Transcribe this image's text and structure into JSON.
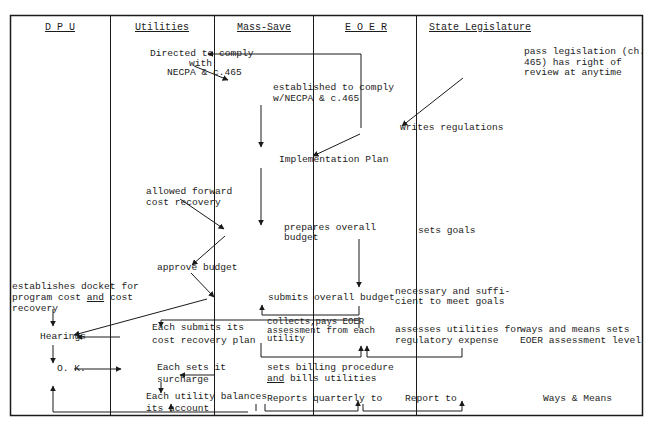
{
  "diagram": {
    "type": "swimlane-flowchart",
    "columns": [
      {
        "id": "dpu",
        "label": "D P U"
      },
      {
        "id": "utilities",
        "label": "Utilities"
      },
      {
        "id": "mass_save",
        "label": "Mass-Save"
      },
      {
        "id": "eoer",
        "label": "E O E R"
      },
      {
        "id": "state_legislature",
        "label": "State Legislature"
      }
    ],
    "nodes": {
      "directed_to_comply_1": "Directed to comply",
      "directed_to_comply_2": "with",
      "directed_to_comply_3": "NECPA & c.465",
      "established_1": "established to comply",
      "established_2": "w/NECPA & c.465",
      "pass_legislation_1": "pass legislation (ch.",
      "pass_legislation_2": "465) has right of",
      "pass_legislation_3": "review at anytime",
      "writes_regulations": "writes regulations",
      "implementation_plan": "Implementation Plan",
      "allowed_forward_1": "allowed forward",
      "allowed_forward_2": "cost recovery",
      "prepares_budget_1": "prepares overall",
      "prepares_budget_2": "budget",
      "sets_goals": "sets goals",
      "approve_budget": "approve budget",
      "establishes_docket_1": "establishes docket for",
      "establishes_docket_2a": "program cost ",
      "establishes_docket_2b": "and",
      "establishes_docket_2c": " cost",
      "establishes_docket_3": "recovery",
      "submits_overall_budget": "submits overall budget",
      "necessary_1": "necessary and suffi-",
      "necessary_2": "cient to meet goals",
      "hearings": "Hearings",
      "each_submits_1": "Each submits its",
      "each_submits_2": "cost recovery plan",
      "collects_1": "collects,pays EOER",
      "collects_2": "assessment from each",
      "collects_3": "utility",
      "assesses_1": "assesses utilities for",
      "assesses_2": "regulatory expense",
      "ways_means_sets_1": "ways and means sets",
      "ways_means_sets_2": "EOER assessment level",
      "ok": "O. K.",
      "each_sets_1": "Each sets it",
      "each_sets_2": "surcharge",
      "sets_billing_1": "sets billing procedure",
      "sets_billing_2a": "and",
      "sets_billing_2b": " bills utilities",
      "each_utility_1": "Each utility balances",
      "each_utility_2": "its account",
      "reports_quarterly": "Reports quarterly to",
      "report_to": "Report to",
      "ways_and_means": "Ways & Means"
    },
    "edges": [
      {
        "from": "writes_regulations",
        "to": "directed_to_comply"
      },
      {
        "from": "directed_to_comply",
        "to": "established"
      },
      {
        "from": "established",
        "to": "implementation_plan"
      },
      {
        "from": "pass_legislation",
        "to": "writes_regulations"
      },
      {
        "from": "writes_regulations",
        "to": "implementation_plan"
      },
      {
        "from": "implementation_plan",
        "to": "prepares_budget"
      },
      {
        "from": "allowed_forward",
        "to": "prepares_budget"
      },
      {
        "from": "prepares_budget",
        "to": "approve_budget"
      },
      {
        "from": "approve_budget",
        "to": "submits_overall_budget"
      },
      {
        "from": "sets_goals",
        "to": "necessary"
      },
      {
        "from": "necessary",
        "to": "submits_overall_budget"
      },
      {
        "from": "necessary",
        "to": "each_submits"
      },
      {
        "from": "submits_overall_budget",
        "to": "hearings"
      },
      {
        "from": "establishes_docket",
        "to": "hearings"
      },
      {
        "from": "each_submits",
        "to": "hearings"
      },
      {
        "from": "hearings",
        "to": "ok"
      },
      {
        "from": "ok",
        "to": "each_sets"
      },
      {
        "from": "sets_billing",
        "to": "each_sets"
      },
      {
        "from": "each_sets",
        "to": "each_utility"
      },
      {
        "from": "collects",
        "to": "assesses"
      },
      {
        "from": "ways_means_sets",
        "to": "assesses"
      },
      {
        "from": "each_utility",
        "to": "ok"
      },
      {
        "from": "reports_quarterly",
        "to": "report_to"
      },
      {
        "from": "report_to",
        "to": "ways_and_means"
      }
    ]
  }
}
